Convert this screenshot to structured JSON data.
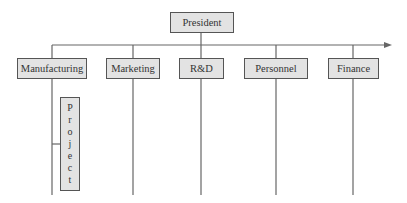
{
  "diagram": {
    "type": "organizational-chart",
    "root": {
      "label": "President"
    },
    "departments": [
      {
        "label": "Manufacturing"
      },
      {
        "label": "Marketing"
      },
      {
        "label": "R&D"
      },
      {
        "label": "Personnel"
      },
      {
        "label": "Finance"
      }
    ],
    "project": {
      "label": "Project",
      "letters": [
        "P",
        "r",
        "o",
        "j",
        "e",
        "c",
        "t"
      ],
      "attached_to": "Manufacturing"
    },
    "colors": {
      "box_fill": "#e3e3e3",
      "line": "#666666",
      "border": "#555555"
    }
  }
}
